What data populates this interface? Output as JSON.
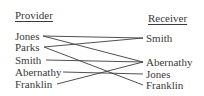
{
  "headers": {
    "provider": "Provider",
    "receiver": "Receiver"
  },
  "providers": [
    {
      "name": "Jones",
      "x": 15,
      "y": 30,
      "ax": 43,
      "ay": 36
    },
    {
      "name": "Parks",
      "x": 15,
      "y": 41,
      "ax": 44,
      "ay": 47
    },
    {
      "name": "Smith",
      "x": 15,
      "y": 54,
      "ax": 46,
      "ay": 60
    },
    {
      "name": "Abernathy",
      "x": 15,
      "y": 66,
      "ax": 63,
      "ay": 72
    },
    {
      "name": "Franklin",
      "x": 15,
      "y": 78,
      "ax": 57,
      "ay": 84
    }
  ],
  "receivers": [
    {
      "name": "Smith",
      "x": 146,
      "y": 32,
      "ax": 143,
      "ay": 38
    },
    {
      "name": "Abernathy",
      "x": 146,
      "y": 56,
      "ax": 143,
      "ay": 62
    },
    {
      "name": "Jones",
      "x": 146,
      "y": 68,
      "ax": 143,
      "ay": 74
    },
    {
      "name": "Franklin",
      "x": 146,
      "y": 79,
      "ax": 143,
      "ay": 85
    }
  ],
  "links": [
    {
      "from": "Jones",
      "to": "Smith"
    },
    {
      "from": "Jones",
      "to": "Abernathy"
    },
    {
      "from": "Parks",
      "to": "Smith"
    },
    {
      "from": "Parks",
      "to": "Franklin"
    },
    {
      "from": "Smith",
      "to": "Abernathy"
    },
    {
      "from": "Abernathy",
      "to": "Jones"
    },
    {
      "from": "Franklin",
      "to": "Abernathy"
    }
  ],
  "colors": {
    "text": "#3a3a3a",
    "line": "#3c3c3c",
    "background": "#ffffff"
  }
}
